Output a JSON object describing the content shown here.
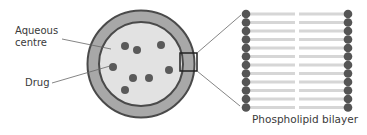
{
  "labels": {
    "aqueous_line1": "Aqueous",
    "aqueous_line2": "centre",
    "drug": "Drug",
    "bilayer": "Phospholipid bilayer"
  },
  "liposome": {
    "center": [
      141,
      64
    ],
    "outer_radius": 54,
    "inner_radius": 42,
    "drug_count": 8
  },
  "bilayer": {
    "rows": 12,
    "colors": {
      "head": "#555555",
      "tail": "#d9d9d9"
    }
  },
  "colors": {
    "outer_ring": "#a8a8a8",
    "ring_border": "#4a4a4a",
    "aqueous": "#e2e2e2",
    "drug": "#5a5a5a",
    "leader_line": "#666666"
  }
}
